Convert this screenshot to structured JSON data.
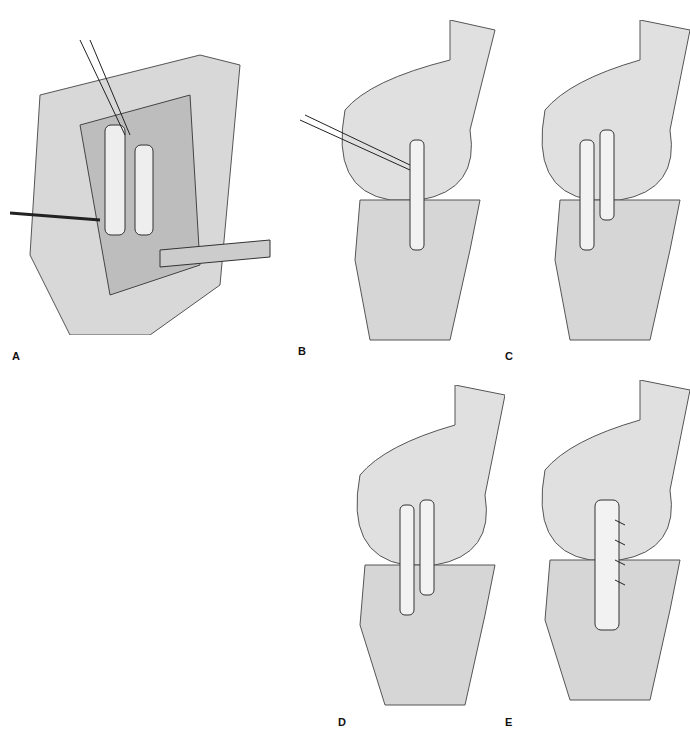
{
  "figure": {
    "panels": [
      {
        "id": "A",
        "label": "A",
        "description": "Surgical exposure with retractors and graft sutures"
      },
      {
        "id": "B",
        "label": "B",
        "description": "Knee lateral view with graft pulled through femoral tunnel"
      },
      {
        "id": "C",
        "label": "C",
        "description": "Graft passed through femoral tunnels and tibial tunnel"
      },
      {
        "id": "D",
        "label": "D",
        "description": "Graft limbs crossed and sutured at tibia"
      },
      {
        "id": "E",
        "label": "E",
        "description": "Final graft repair sutured along length"
      }
    ]
  }
}
